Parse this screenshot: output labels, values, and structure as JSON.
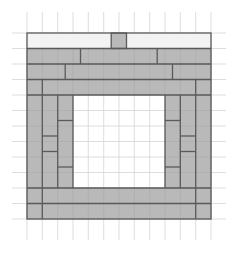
{
  "diagram": {
    "title": "",
    "grid": {
      "cols": 13,
      "rows": 14
    },
    "colors": {
      "background": "#ffffff",
      "gridline": "#d4d4d4",
      "fill": "#b9b9b9",
      "top_row_fill": "#f3f3f3",
      "border": "#5a5a5a"
    }
  }
}
